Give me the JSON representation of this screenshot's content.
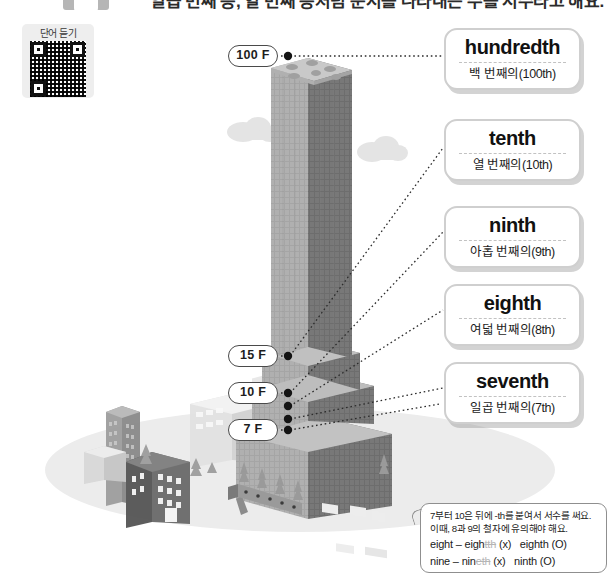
{
  "header": {
    "title": "일곱 번째 층, 열 번째 층처럼 순서를 나타내는 수를 서수라고 해요."
  },
  "audio_qr": {
    "label": "단어 듣기",
    "icon": "qr-code-icon"
  },
  "floor_markers": [
    {
      "label": "100 F",
      "x": 228,
      "y": 45
    },
    {
      "label": "15 F",
      "x": 228,
      "y": 345
    },
    {
      "label": "10 F",
      "x": 228,
      "y": 382
    },
    {
      "label": "7 F",
      "x": 228,
      "y": 419
    }
  ],
  "word_cards": [
    {
      "english": "hundredth",
      "korean": "백 번째의(100th)",
      "top": 28
    },
    {
      "english": "tenth",
      "korean": "열 번째의(10th)",
      "top": 119
    },
    {
      "english": "ninth",
      "korean": "아홉 번째의(9th)",
      "top": 206
    },
    {
      "english": "eighth",
      "korean": "여덟 번째의(8th)",
      "top": 284
    },
    {
      "english": "seventh",
      "korean": "일곱 번째의(7th)",
      "top": 362
    }
  ],
  "note": {
    "line1": "7부터 10은 뒤에 -th를 붙여서 서수를 써요.",
    "line2": "이때, 8과 9의 철자에 유의해야 해요.",
    "example1": {
      "base": "eight",
      "dash": "–",
      "wrong_stem": "eigh",
      "wrong_suffix": "tth",
      "wrong_mark": "(x)",
      "right": "eighth",
      "right_mark": "(O)"
    },
    "example2": {
      "base": "nine",
      "dash": "–",
      "wrong_stem": "nin",
      "wrong_suffix": "eth",
      "wrong_mark": "(x)",
      "right": "ninth",
      "right_mark": "(O)"
    }
  },
  "colors": {
    "background": "#ffffff",
    "card_border": "#cfcfcf",
    "pill_border": "#4a4a4a",
    "tower_light": "#9a9a9a",
    "tower_dark": "#6f6f6f",
    "ground": "#ececec"
  }
}
